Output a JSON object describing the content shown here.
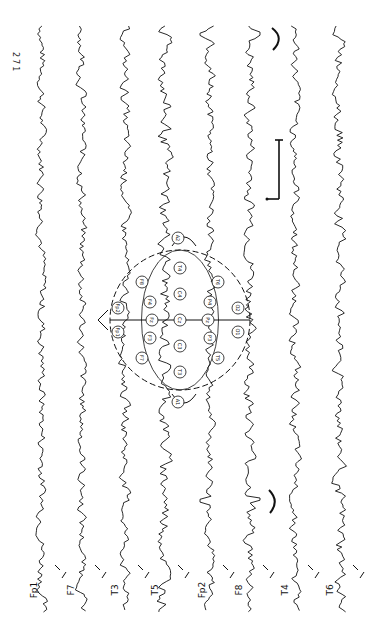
{
  "figure": {
    "page_number": "271",
    "orientation": "rotated-90",
    "montage": "longitudinal bipolar",
    "channels": [
      {
        "label": "Fp1",
        "tail": "F7"
      },
      {
        "label": "F7",
        "tail": "T3"
      },
      {
        "label": "T3",
        "tail": "T5"
      },
      {
        "label": "T5",
        "tail": "O1"
      },
      {
        "label": "Fp2",
        "tail": "F8"
      },
      {
        "label": "F8",
        "tail": "T4"
      },
      {
        "label": "T4",
        "tail": "T6"
      },
      {
        "label": "T6",
        "tail": "O2"
      }
    ],
    "head_diagram": {
      "electrodes": [
        "Fp1",
        "Fp2",
        "F7",
        "F3",
        "Fz",
        "F4",
        "F8",
        "A1",
        "T3",
        "C3",
        "Cz",
        "C4",
        "T4",
        "A2",
        "T5",
        "P3",
        "Pz",
        "P4",
        "T6",
        "O1",
        "O2"
      ]
    },
    "annotations": {
      "calibration_bar": "present",
      "arc_marks": 2,
      "sharp_transients": 2
    },
    "ink_color": "#111111",
    "background_color": "#ffffff"
  }
}
